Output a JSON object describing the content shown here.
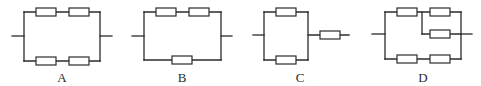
{
  "figure": {
    "colors": {
      "line": "#2b2b2b",
      "background": "#ffffff"
    },
    "diagrams": [
      {
        "label": "A",
        "topology": "two branches in parallel; each branch has two resistors in series",
        "resistor_count": 4
      },
      {
        "label": "B",
        "topology": "top branch two resistors in series, parallel with bottom branch single resistor",
        "resistor_count": 3
      },
      {
        "label": "C",
        "topology": "two single-resistor branches in parallel, then in series with one resistor",
        "resistor_count": 3
      },
      {
        "label": "D",
        "topology": "top: resistor in series with two parallel resistors; parallel with bottom branch of two resistors in series",
        "resistor_count": 5
      }
    ]
  }
}
